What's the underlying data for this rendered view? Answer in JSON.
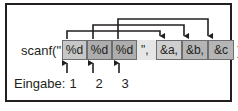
{
  "figure": {
    "kind": "scanf-format-mapping-diagram",
    "language": "de",
    "colors": {
      "frame_border": "#231f20",
      "format_box_fill": "#b3b3b3",
      "arg_box_fill": "#c2c2c2",
      "string_fill": "#e6e6e6",
      "connector": "#231f20",
      "text": "#231f20"
    }
  },
  "code": {
    "prefix": "scanf(\"",
    "format_specifiers": [
      {
        "text": "%d",
        "index": 1
      },
      {
        "text": "%d",
        "index": 2
      },
      {
        "text": "%d",
        "index": 3
      }
    ],
    "string_close": "\", ",
    "arguments": [
      {
        "text": "&a,",
        "index": 1
      },
      {
        "text": "&b,",
        "index": 2
      },
      {
        "text": "&c",
        "index": 3
      }
    ],
    "suffix": ");"
  },
  "input": {
    "label": "Eingabe:",
    "values": [
      "1",
      "2",
      "3"
    ]
  },
  "connections": [
    {
      "from": "format_specifier_1",
      "to": "argument_1"
    },
    {
      "from": "format_specifier_2",
      "to": "argument_2"
    },
    {
      "from": "format_specifier_3",
      "to": "argument_3"
    },
    {
      "from": "input_value_1",
      "to": "format_specifier_1"
    },
    {
      "from": "input_value_2",
      "to": "format_specifier_2"
    },
    {
      "from": "input_value_3",
      "to": "format_specifier_3"
    }
  ]
}
